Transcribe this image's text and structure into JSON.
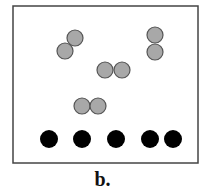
{
  "figure": {
    "label": "b.",
    "frame": {
      "x": 13,
      "y": 6,
      "width": 185,
      "height": 157,
      "stroke": "#444444"
    },
    "gray_particles": {
      "fill": "#a8a8a8",
      "stroke": "#555555",
      "radius": 8,
      "pairs": [
        [
          [
            75,
            38
          ],
          [
            65,
            51
          ]
        ],
        [
          [
            155,
            35
          ],
          [
            155,
            52
          ]
        ],
        [
          [
            105,
            70
          ],
          [
            122,
            70
          ]
        ],
        [
          [
            82,
            106
          ],
          [
            98,
            106
          ]
        ]
      ]
    },
    "black_particles": {
      "fill": "#000000",
      "radius": 9,
      "y": 139,
      "x": [
        49,
        82,
        116,
        150,
        173
      ]
    }
  }
}
